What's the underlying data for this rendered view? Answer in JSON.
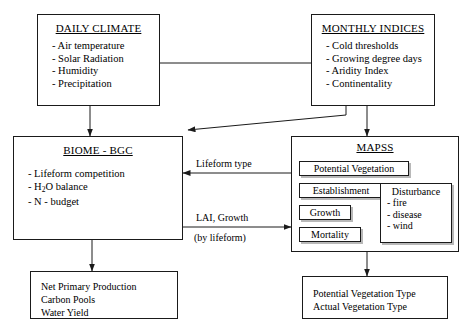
{
  "diagram": {
    "daily_climate": {
      "title": "DAILY CLIMATE",
      "items": [
        "- Air temperature",
        "- Solar Radiation",
        "- Humidity",
        "- Precipitation"
      ]
    },
    "monthly_indices": {
      "title": "MONTHLY INDICES",
      "items": [
        "- Cold thresholds",
        "- Growing degree days",
        "- Aridity Index",
        "- Continentality"
      ]
    },
    "biome_bgc": {
      "title": "BIOME - BGC",
      "item1": "- Lifeform competition",
      "item2_pre": "- H",
      "item2_sub": "2",
      "item2_post": "O balance",
      "item3": "- N - budget"
    },
    "mapss": {
      "title": "MAPSS",
      "chain": [
        "Potential Vegetation",
        "Establishment",
        "Growth",
        "Mortality"
      ],
      "disturbance": {
        "title": "Disturbance",
        "items": [
          "- fire",
          "- disease",
          "- wind"
        ]
      }
    },
    "biome_output": {
      "lines": [
        "Net Primary Production",
        "Carbon Pools",
        "Water Yield"
      ]
    },
    "mapss_output": {
      "lines": [
        "Potential Vegetation Type",
        "Actual Vegetation Type"
      ]
    },
    "edge_labels": {
      "lifeform_type": "Lifeform type",
      "lai_growth": "LAI, Growth",
      "by_lifeform": "(by lifeform)"
    },
    "colors": {
      "stroke": "#1a1a1a",
      "shadow": "#b8b8b8",
      "background": "#ffffff"
    }
  }
}
